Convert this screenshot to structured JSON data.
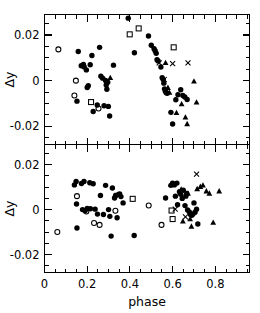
{
  "figure": {
    "title": "",
    "xlabel": "phase",
    "ylabel": "Δy"
  },
  "chart_data": {
    "type": "scatter",
    "title": "",
    "xlabel": "phase",
    "ylabel": "Δy",
    "xlim": [
      0.0,
      0.96
    ],
    "ylim": [
      -0.028,
      0.029
    ],
    "grid": false,
    "legend": "none",
    "xticks": [
      0.0,
      0.2,
      0.4,
      0.6,
      0.8
    ],
    "xticklabels": [
      "0",
      "0.2",
      "0.4",
      "0.6",
      "0.8"
    ],
    "xminor_step": 0.05,
    "yticks": [
      0.02,
      0.0,
      -0.02
    ],
    "yticklabels": [
      "0.02",
      "0",
      "-0.02"
    ],
    "yminor_step": 0.005,
    "panels": [
      {
        "name": "top-panel",
        "index": 0,
        "ylabel": "Δy",
        "xlabel": "",
        "xticklabels_visible": false,
        "series": [
          {
            "name": "open-circle",
            "marker": "open-circle",
            "points": [
              [
                0.065,
                0.0137
              ],
              [
                0.147,
                0.0
              ],
              [
                0.14,
                -0.0065
              ],
              [
                0.253,
                -0.0122
              ]
            ]
          },
          {
            "name": "open-square",
            "marker": "open-square",
            "points": [
              [
                0.218,
                -0.0094
              ],
              [
                0.399,
                0.0203
              ],
              [
                0.441,
                0.0229
              ],
              [
                0.605,
                0.0146
              ]
            ]
          },
          {
            "name": "filled-circle",
            "marker": "filled-circle",
            "points": [
              [
                0.152,
                -0.009
              ],
              [
                0.158,
                0.0128
              ],
              [
                0.172,
                0.0065
              ],
              [
                0.182,
                0.0071
              ],
              [
                0.186,
                0.006
              ],
              [
                0.196,
                0.0047
              ],
              [
                0.2,
                -0.003
              ],
              [
                0.205,
                -0.0022
              ],
              [
                0.214,
                0.007
              ],
              [
                0.222,
                0.011
              ],
              [
                0.228,
                -0.0135
              ],
              [
                0.247,
                -0.0107
              ],
              [
                0.258,
                0.0146
              ],
              [
                0.264,
                0.0019
              ],
              [
                0.272,
                0.0011
              ],
              [
                0.279,
                -0.011
              ],
              [
                0.286,
                0.0001
              ],
              [
                0.289,
                -0.0019
              ],
              [
                0.292,
                -0.0038
              ],
              [
                0.296,
                -0.0007
              ],
              [
                0.299,
                -0.0113
              ],
              [
                0.305,
                -0.0155
              ],
              [
                0.323,
                0.0068
              ],
              [
                0.392,
                0.0274
              ],
              [
                0.421,
                0.0122
              ],
              [
                0.487,
                0.0196
              ],
              [
                0.5,
                0.0155
              ],
              [
                0.513,
                0.014
              ],
              [
                0.518,
                0.0131
              ],
              [
                0.523,
                0.012
              ],
              [
                0.527,
                0.0092
              ],
              [
                0.532,
                0.0086
              ],
              [
                0.545,
                0.006
              ],
              [
                0.551,
                0.0013
              ],
              [
                0.556,
                0.0005
              ],
              [
                0.559,
                -0.0011
              ],
              [
                0.562,
                -0.0036
              ],
              [
                0.566,
                -0.0047
              ],
              [
                0.57,
                -0.0053
              ],
              [
                0.575,
                -0.0055
              ],
              [
                0.592,
                -0.0139
              ],
              [
                0.6,
                -0.019
              ],
              [
                0.615,
                -0.0084
              ],
              [
                0.625,
                -0.0062
              ],
              [
                0.638,
                -0.004
              ],
              [
                0.648,
                -0.0065
              ],
              [
                0.657,
                -0.0072
              ],
              [
                0.668,
                -0.0083
              ]
            ]
          },
          {
            "name": "cross",
            "marker": "cross",
            "points": [
              [
                0.537,
                0.0078
              ],
              [
                0.561,
                0.0005
              ],
              [
                0.6,
                0.0075
              ],
              [
                0.672,
                0.0078
              ]
            ]
          },
          {
            "name": "filled-triangle",
            "marker": "filled-triangle",
            "points": [
              [
                0.308,
                0.0012
              ],
              [
                0.567,
                0.0078
              ],
              [
                0.578,
                -0.0031
              ],
              [
                0.585,
                -0.0052
              ],
              [
                0.618,
                -0.0141
              ],
              [
                0.642,
                -0.0103
              ],
              [
                0.66,
                -0.0161
              ],
              [
                0.668,
                -0.019
              ],
              [
                0.7,
                -0.0003
              ],
              [
                0.712,
                -0.0095
              ]
            ]
          }
        ]
      },
      {
        "name": "bottom-panel",
        "index": 1,
        "ylabel": "Δy",
        "xlabel": "phase",
        "xticklabels_visible": true,
        "series": [
          {
            "name": "open-circle",
            "marker": "open-circle",
            "points": [
              [
                0.06,
                -0.01
              ],
              [
                0.152,
                0.006
              ],
              [
                0.196,
                -0.0008
              ],
              [
                0.232,
                -0.006
              ],
              [
                0.258,
                -0.0068
              ],
              [
                0.332,
                -0.0005
              ],
              [
                0.488,
                0.0018
              ],
              [
                0.548,
                -0.0068
              ]
            ]
          },
          {
            "name": "open-square",
            "marker": "open-square",
            "points": [
              [
                0.413,
                0.0048
              ],
              [
                0.595,
                -0.0004
              ],
              [
                0.6,
                -0.0042
              ]
            ]
          },
          {
            "name": "filled-circle",
            "marker": "filled-circle",
            "points": [
              [
                0.14,
                0.011
              ],
              [
                0.148,
                0.0125
              ],
              [
                0.15,
                0.0025
              ],
              [
                0.152,
                -0.0082
              ],
              [
                0.173,
                0.0116
              ],
              [
                0.178,
                0.0
              ],
              [
                0.185,
                0.0125
              ],
              [
                0.19,
                -0.0005
              ],
              [
                0.2,
                0.0005
              ],
              [
                0.212,
                0.012
              ],
              [
                0.215,
                0.0004
              ],
              [
                0.228,
                0.0115
              ],
              [
                0.237,
                0.0002
              ],
              [
                0.248,
                -0.002
              ],
              [
                0.262,
                0.0063
              ],
              [
                0.276,
                -0.0022
              ],
              [
                0.286,
                0.0108
              ],
              [
                0.3,
                0.0
              ],
              [
                0.306,
                -0.003
              ],
              [
                0.312,
                -0.0118
              ],
              [
                0.318,
                0.0096
              ],
              [
                0.328,
                0.0052
              ],
              [
                0.333,
                0.0063
              ],
              [
                0.34,
                -0.0036
              ],
              [
                0.346,
                0.0068
              ],
              [
                0.352,
                0.007
              ],
              [
                0.358,
                0.0058
              ],
              [
                0.368,
                0.003
              ],
              [
                0.42,
                -0.0115
              ],
              [
                0.567,
                0.0052
              ],
              [
                0.592,
                0.0108
              ],
              [
                0.6,
                0.0118
              ],
              [
                0.608,
                0.011
              ],
              [
                0.613,
                0.006
              ],
              [
                0.62,
                0.0118
              ],
              [
                0.623,
                0.0022
              ],
              [
                0.632,
                0.008
              ],
              [
                0.638,
                0.0068
              ],
              [
                0.645,
                0.005
              ],
              [
                0.65,
                0.0086
              ],
              [
                0.658,
                0.0018
              ],
              [
                0.662,
                0.006
              ],
              [
                0.666,
                0.0072
              ],
              [
                0.67,
                -0.0002
              ],
              [
                0.678,
                -0.001
              ],
              [
                0.684,
                -0.0022
              ],
              [
                0.69,
                -0.0025
              ],
              [
                0.695,
                -0.002
              ],
              [
                0.7,
                0.003
              ],
              [
                0.705,
                -0.0012
              ],
              [
                0.712,
                0.0002
              ],
              [
                0.718,
                -0.0064
              ]
            ]
          },
          {
            "name": "cross",
            "marker": "cross",
            "points": [
              [
                0.612,
                0.0002
              ],
              [
                0.66,
                -0.0032
              ],
              [
                0.712,
                0.0158
              ]
            ]
          },
          {
            "name": "filled-triangle",
            "marker": "filled-triangle",
            "points": [
              [
                0.33,
                0.0062
              ],
              [
                0.592,
                0.0112
              ],
              [
                0.64,
                0.009
              ],
              [
                0.648,
                -0.0052
              ],
              [
                0.672,
                0.0072
              ],
              [
                0.682,
                -0.0042
              ],
              [
                0.688,
                -0.0075
              ],
              [
                0.715,
                0.0092
              ],
              [
                0.73,
                0.0102
              ],
              [
                0.742,
                0.0108
              ],
              [
                0.758,
                0.0082
              ],
              [
                0.772,
                0.0072
              ],
              [
                0.79,
                -0.0058
              ],
              [
                0.818,
                0.0082
              ]
            ]
          }
        ]
      }
    ]
  }
}
